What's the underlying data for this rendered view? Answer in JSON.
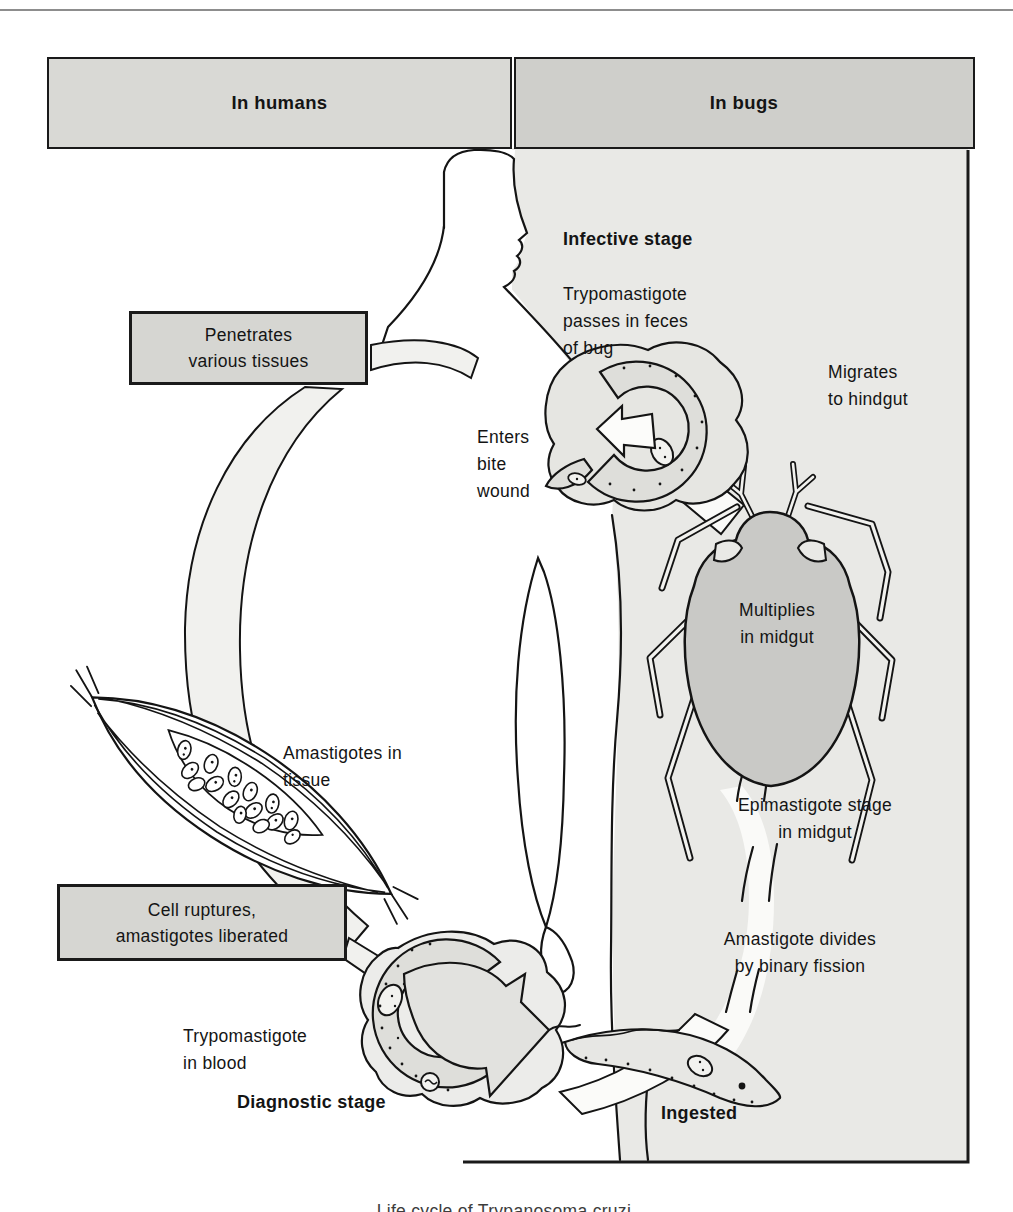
{
  "header": {
    "left_label": "In humans",
    "right_label": "In bugs"
  },
  "labels": {
    "infective_stage": "Infective stage",
    "trypomastigote_feces": [
      "Trypomastigote",
      "passes in feces",
      "of bug"
    ],
    "migrates_hindgut": [
      "Migrates",
      "to hindgut"
    ],
    "penetrates_box": [
      "Penetrates",
      "various tissues"
    ],
    "enters_bite_wound": [
      "Enters",
      "bite",
      "wound"
    ],
    "multiplies_midgut": [
      "Multiplies",
      "in midgut"
    ],
    "amastigotes_tissue": [
      "Amastigotes in",
      "tissue"
    ],
    "epimastigote_stage": [
      "Epimastigote stage",
      "in midgut"
    ],
    "cell_ruptures_box": [
      "Cell ruptures,",
      "amastigotes liberated"
    ],
    "amastigote_divides": [
      "Amastigote divides",
      "by binary fission"
    ],
    "trypomastigote_blood": [
      "Trypomastigote",
      "in blood"
    ],
    "diagnostic_stage": "Diagnostic stage",
    "ingested": "Ingested"
  },
  "caption": "Life cycle of Trypanosoma cruzi.",
  "colors": {
    "panel_gray": "#e9e9e6",
    "header_left_gray": "#d9d9d5",
    "header_right_gray": "#cfcfcb",
    "label_box_gray": "#d6d6d2",
    "bug_body_gray": "#c9c9c6",
    "parasite_gray": "#dededa",
    "outline_black": "#141414"
  }
}
